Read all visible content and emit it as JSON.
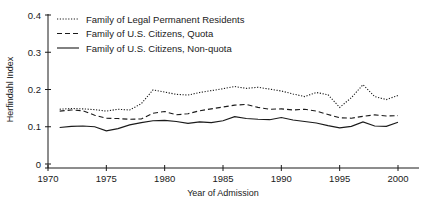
{
  "chart_data": {
    "type": "line",
    "title": "",
    "xlabel": "Year of Admission",
    "ylabel": "Herfindahl Index",
    "xlim": [
      1970,
      2000
    ],
    "ylim": [
      0,
      0.4
    ],
    "xticks": [
      "1970",
      "1975",
      "1980",
      "1985",
      "1990",
      "1995",
      "2000"
    ],
    "yticks": [
      "0",
      "0.1",
      "0.2",
      "0.3",
      "0.4"
    ],
    "grid": false,
    "legend_position": "top-left",
    "x": [
      1971,
      1972,
      1973,
      1974,
      1975,
      1976,
      1977,
      1978,
      1979,
      1980,
      1981,
      1982,
      1983,
      1984,
      1985,
      1986,
      1987,
      1988,
      1989,
      1990,
      1991,
      1992,
      1993,
      1994,
      1995,
      1996,
      1997,
      1998,
      1999,
      2000
    ],
    "series": [
      {
        "name": "Family of Legal Permanent Residents",
        "style": "dotted",
        "values": [
          0.147,
          0.149,
          0.148,
          0.146,
          0.142,
          0.147,
          0.145,
          0.162,
          0.199,
          0.193,
          0.187,
          0.185,
          0.192,
          0.197,
          0.202,
          0.208,
          0.203,
          0.206,
          0.201,
          0.196,
          0.188,
          0.181,
          0.192,
          0.186,
          0.152,
          0.178,
          0.213,
          0.181,
          0.173,
          0.184
        ]
      },
      {
        "name": "Family of U.S. Citizens, Quota",
        "style": "dashed",
        "values": [
          0.142,
          0.145,
          0.143,
          0.131,
          0.123,
          0.122,
          0.12,
          0.121,
          0.136,
          0.141,
          0.132,
          0.135,
          0.143,
          0.148,
          0.153,
          0.158,
          0.16,
          0.152,
          0.147,
          0.148,
          0.145,
          0.147,
          0.142,
          0.133,
          0.124,
          0.123,
          0.128,
          0.132,
          0.129,
          0.13
        ]
      },
      {
        "name": "Family of U.S. Citizens, Non-quota",
        "style": "solid",
        "values": [
          0.098,
          0.101,
          0.102,
          0.1,
          0.089,
          0.095,
          0.105,
          0.111,
          0.116,
          0.117,
          0.114,
          0.109,
          0.113,
          0.111,
          0.116,
          0.127,
          0.122,
          0.12,
          0.119,
          0.125,
          0.118,
          0.114,
          0.11,
          0.103,
          0.097,
          0.101,
          0.113,
          0.102,
          0.101,
          0.112
        ]
      }
    ]
  },
  "legend": {
    "entries": [
      {
        "label": "Family of Legal Permanent Residents",
        "style": "dotted"
      },
      {
        "label": "Family of U.S. Citizens, Quota",
        "style": "dashed"
      },
      {
        "label": "Family of U.S. Citizens, Non-quota",
        "style": "solid"
      }
    ]
  },
  "colors": {
    "ink": "#1a1a1a",
    "background": "#ffffff"
  }
}
